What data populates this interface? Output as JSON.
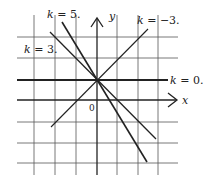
{
  "figure": {
    "axes": {
      "x_label": "x",
      "y_label": "y",
      "origin_label": "0"
    },
    "lines": [
      {
        "k_var": "k",
        "eq": " = ",
        "k_value": "5.",
        "label": "k = 5."
      },
      {
        "k_var": "k",
        "eq": " = ",
        "k_value": "3.",
        "label": "k = 3."
      },
      {
        "k_var": "k",
        "eq": " = ",
        "k_value": "−3.",
        "label": "k = −3."
      },
      {
        "k_var": "k",
        "eq": " = ",
        "k_value": "0.",
        "label": "k = 0."
      }
    ],
    "colors": {
      "ink": "#222222",
      "grid": "#555555",
      "background": "#ffffff"
    }
  }
}
